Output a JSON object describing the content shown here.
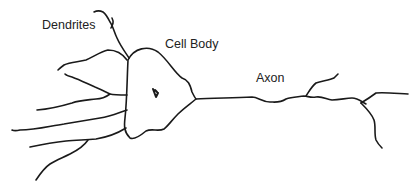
{
  "diagram": {
    "labels": {
      "dendrites": "Dendrites",
      "cell_body": "Cell Body",
      "axon": "Axon"
    },
    "colors": {
      "line": "#1a1a1a",
      "text": "#222222",
      "background": "#ffffff"
    }
  }
}
